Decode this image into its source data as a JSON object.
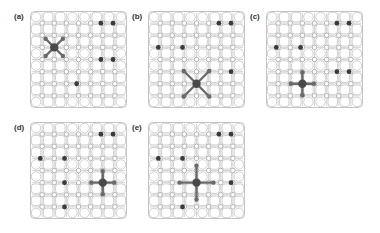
{
  "figure": {
    "panels": [
      {
        "label": "(a)",
        "x": 30,
        "y": 11,
        "size": 97,
        "dopants": [
          [
            5,
            1
          ],
          [
            6,
            1
          ],
          [
            5,
            4
          ],
          [
            6,
            4
          ],
          [
            3,
            6
          ]
        ],
        "defect": {
          "col": 1,
          "row": 3,
          "shape": "x-cross"
        }
      },
      {
        "label": "(b)",
        "x": 148,
        "y": 11,
        "size": 97,
        "dopants": [
          [
            5,
            1
          ],
          [
            6,
            1
          ],
          [
            0,
            3
          ],
          [
            2,
            3
          ],
          [
            6,
            5
          ]
        ],
        "defect": {
          "col": 3,
          "row": 6,
          "shape": "x-cross-large"
        }
      },
      {
        "label": "(c)",
        "x": 266,
        "y": 11,
        "size": 97,
        "dopants": [
          [
            5,
            1
          ],
          [
            6,
            1
          ],
          [
            0,
            3
          ],
          [
            2,
            3
          ],
          [
            5,
            5
          ],
          [
            6,
            5
          ]
        ],
        "defect": {
          "col": 2,
          "row": 6,
          "shape": "plus"
        }
      },
      {
        "label": "(d)",
        "x": 30,
        "y": 122,
        "size": 97,
        "dopants": [
          [
            5,
            1
          ],
          [
            6,
            1
          ],
          [
            0,
            3
          ],
          [
            2,
            3
          ],
          [
            2,
            5
          ],
          [
            2,
            7
          ]
        ],
        "defect": {
          "col": 5,
          "row": 5,
          "shape": "plus"
        }
      },
      {
        "label": "(e)",
        "x": 148,
        "y": 122,
        "size": 97,
        "dopants": [
          [
            5,
            1
          ],
          [
            6,
            1
          ],
          [
            0,
            3
          ],
          [
            2,
            3
          ],
          [
            6,
            5
          ],
          [
            2,
            7
          ]
        ],
        "defect": {
          "col": 3,
          "row": 5,
          "shape": "plus-large"
        }
      }
    ],
    "colors": {
      "line": "#c4c4c4",
      "node_fill": "#ffffff",
      "node_stroke": "#a8a8a8",
      "dopant": "#3a3a3a",
      "defect": "#4a4a4a",
      "defect_arm": "#6a6a6a"
    }
  }
}
